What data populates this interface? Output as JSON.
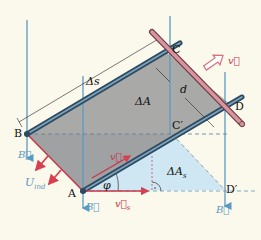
{
  "diagram": {
    "points": {
      "A": "A",
      "B": "B",
      "C": "C",
      "D": "D",
      "C_prime": "C′",
      "D_prime": "D′"
    },
    "labels": {
      "delta_s": "Δs",
      "delta_A": "ΔA",
      "delta_A_s_main": "ΔA",
      "delta_A_s_sub": "s",
      "d": "d",
      "phi": "φ",
      "v": "v⃗",
      "v_arrow": "v⃗",
      "v_s_main": "v⃗",
      "v_s_sub": "s",
      "U_main": "U",
      "U_sub": "ind",
      "B_field": "B⃗"
    },
    "colors": {
      "background": "#fbf8ec",
      "field_lines": "#5a9bc4",
      "rails": "#3c5f78",
      "rod": "#c07a85",
      "area_gray": "#a9a9a7",
      "area_blue": "#cfe6f3",
      "vector_red": "#d6404f"
    }
  }
}
